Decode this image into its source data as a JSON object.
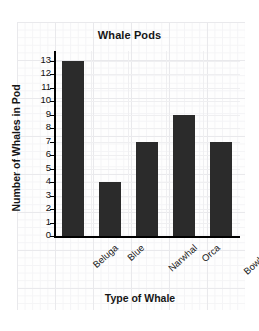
{
  "chart_data": {
    "type": "bar",
    "title": "Whale Pods",
    "xlabel": "Type of Whale",
    "ylabel": "Number of Whales in Pod",
    "categories": [
      "Beluga",
      "Blue",
      "Narwhal",
      "Orca",
      "Bowhead"
    ],
    "values": [
      13,
      4,
      7,
      9,
      7
    ],
    "ylim": [
      0,
      13
    ],
    "ytick_labels": [
      "13",
      "12",
      "11",
      "10",
      "9",
      "8",
      "7",
      "6",
      "5",
      "4",
      "3",
      "2",
      "1",
      "0"
    ],
    "ytick_values": [
      13,
      12,
      11,
      10,
      9,
      8,
      7,
      6,
      5,
      4,
      3,
      2,
      1,
      0
    ],
    "grid": true,
    "legend": null,
    "bar_color": "#2b2b2b",
    "axis_color": "#000000",
    "background_color": "#fefefe",
    "gridline_color": "#e9e9ec"
  }
}
